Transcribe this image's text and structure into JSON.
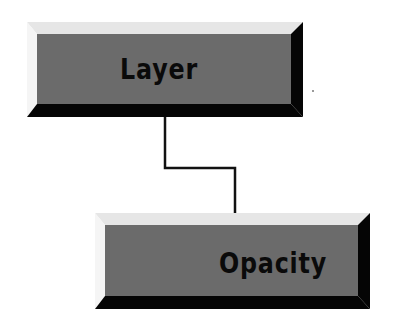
{
  "diagram": {
    "nodes": [
      {
        "id": "layer",
        "label": "Layer"
      },
      {
        "id": "opacity",
        "label": "Opacity"
      }
    ],
    "edges": [
      {
        "from": "layer",
        "to": "opacity"
      }
    ]
  },
  "colors": {
    "face": "#6b6b6b",
    "bevel_top": "#e6e6e6",
    "bevel_left": "#f5f5f5",
    "bevel_shadow": "#050505",
    "connector": "#111111"
  }
}
